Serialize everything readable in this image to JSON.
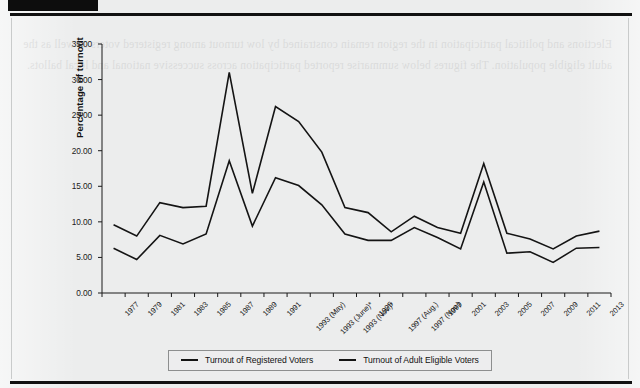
{
  "page": {
    "header_bar_present": true,
    "background_color": "#eceded",
    "rule_color": "#111111",
    "bleed_text": "Elections and political participation in the region remain constrained by low turnout among registered voters as well as the adult eligible population. The figures below summarise reported participation across successive national and local ballots."
  },
  "chart_data": {
    "type": "line",
    "title": "",
    "xlabel": "",
    "ylabel": "Percentage of turnout",
    "ylim": [
      0.0,
      35.0
    ],
    "ytick_step": 5.0,
    "ytick_labels": [
      "0.00",
      "5.00",
      "10.00",
      "15.00",
      "20.00",
      "25.00",
      "30.00",
      "35.00"
    ],
    "ytick_values": [
      0.0,
      5.0,
      10.0,
      15.0,
      20.0,
      25.0,
      30.0,
      35.0
    ],
    "grid": false,
    "legend_position": "bottom-center",
    "categories": [
      "1977",
      "1979",
      "1981",
      "1983",
      "1985",
      "1987",
      "1989",
      "1991",
      "1993 (May)",
      "1993 (June)*",
      "1993 (Nov.)*",
      "1995",
      "1997 (Aug.)",
      "1997 (Nov.)",
      "1999",
      "2001",
      "2003",
      "2005",
      "2007",
      "2009",
      "2011",
      "2013"
    ],
    "series": [
      {
        "name": "Turnout of Registered Voters",
        "values": [
          9.6,
          8.0,
          12.7,
          12.0,
          12.2,
          31.0,
          14.0,
          26.2,
          24.1,
          19.8,
          12.0,
          11.3,
          8.6,
          10.8,
          9.2,
          8.4,
          18.2,
          8.4,
          7.6,
          6.2,
          8.0,
          8.7
        ]
      },
      {
        "name": "Turnout of Adult Eligible Voters",
        "values": [
          6.3,
          4.7,
          8.1,
          6.9,
          8.3,
          18.6,
          9.4,
          16.2,
          15.1,
          12.4,
          8.3,
          7.4,
          7.4,
          9.2,
          7.8,
          6.2,
          15.6,
          5.6,
          5.8,
          4.3,
          6.3,
          6.4
        ]
      }
    ],
    "line_color": "#141414",
    "line_width": 1.6
  },
  "legend": {
    "entries": [
      {
        "label": "Turnout of Registered Voters",
        "color": "#141414"
      },
      {
        "label": "Turnout of Adult Eligible Voters",
        "color": "#141414"
      }
    ]
  }
}
